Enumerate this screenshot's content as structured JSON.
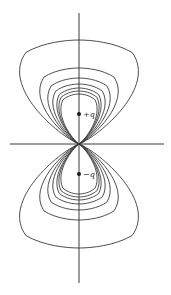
{
  "figure": {
    "title": "",
    "center": {
      "x": 79,
      "y": 144
    },
    "vertical_axis": {
      "x": 79,
      "y1": 13,
      "y2": 283
    },
    "horizontal_axis": {
      "y": 144,
      "x1": 10,
      "x2": 164
    },
    "charges": [
      {
        "label": "+q",
        "x": 79,
        "y": 114,
        "sign": "positive"
      },
      {
        "label": "−q",
        "x": 79,
        "y": 174,
        "sign": "negative"
      }
    ],
    "field_line_tops": [
      40,
      68,
      78,
      84,
      88,
      91,
      94
    ],
    "field_line_half_widths": [
      59,
      39,
      31,
      26,
      22,
      20,
      18
    ],
    "line_color": "#3a3a3a",
    "charge_color": "#1a1a1a"
  }
}
